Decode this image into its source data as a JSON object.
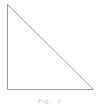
{
  "figure": {
    "type": "right-triangle",
    "background_color": "#ffffff",
    "stroke_color": "#9a9a9a",
    "stroke_width": 1,
    "canvas": {
      "width": 99,
      "height": 107
    },
    "vertices": {
      "top": {
        "x": 7,
        "y": 4
      },
      "bottom_left": {
        "x": 7,
        "y": 89
      },
      "bottom_right": {
        "x": 93,
        "y": 89
      }
    },
    "edges": [
      {
        "name": "vertical-leg",
        "from": "top",
        "to": "bottom_left"
      },
      {
        "name": "horizontal-leg",
        "from": "bottom_left",
        "to": "bottom_right"
      },
      {
        "name": "hypotenuse",
        "from": "top",
        "to": "bottom_right"
      }
    ],
    "right_angle_at": "bottom_left"
  },
  "caption": {
    "label": "Fig.",
    "number": "1",
    "color": "#b9b9b9"
  }
}
